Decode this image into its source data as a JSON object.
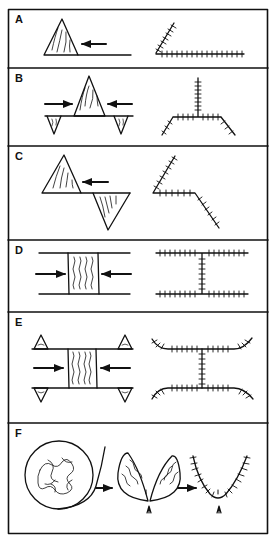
{
  "figure": {
    "stroke_color": "#111111",
    "background": "#ffffff",
    "panels": [
      {
        "label": "A",
        "description": "Single wedge with compressive arrow from right; resulting angled suture joint"
      },
      {
        "label": "B",
        "description": "Central wedge compressed from both sides with two inverted wedges below; resulting Y-shaped suture"
      },
      {
        "label": "C",
        "description": "Upright and inverted wedges offset with arrow from right; resulting zigzag suture"
      },
      {
        "label": "D",
        "description": "Rectangular block between parallel plates compressed from both sides; resulting H-shaped suture"
      },
      {
        "label": "E",
        "description": "Rectangular block with four corner wedges compressed from both sides; resulting H-shaped suture with curved ends"
      },
      {
        "label": "F",
        "description": "Circular mass leading to two lens-shaped wedges meeting at a point (arrowhead), then a V/U-shaped suture"
      }
    ]
  }
}
